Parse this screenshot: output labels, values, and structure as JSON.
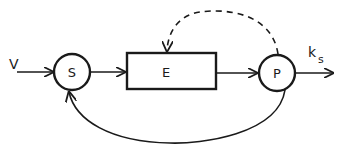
{
  "diagram": {
    "input_label": "V",
    "output_label_main": "k",
    "output_label_sub": "s",
    "nodes": {
      "substrate": {
        "label": "S",
        "shape": "circle"
      },
      "enzyme": {
        "label": "E",
        "shape": "rectangle"
      },
      "product": {
        "label": "P",
        "shape": "circle"
      }
    },
    "edges": [
      {
        "from": "V",
        "to": "S",
        "style": "solid"
      },
      {
        "from": "S",
        "to": "E",
        "style": "solid"
      },
      {
        "from": "E",
        "to": "P",
        "style": "solid"
      },
      {
        "from": "P",
        "to": "k_s",
        "style": "solid"
      },
      {
        "from": "P",
        "to": "E",
        "style": "dashed"
      },
      {
        "from": "P",
        "to": "S",
        "style": "solid"
      }
    ],
    "colors": {
      "stroke": "#1a1a1a",
      "background": "#ffffff"
    }
  }
}
